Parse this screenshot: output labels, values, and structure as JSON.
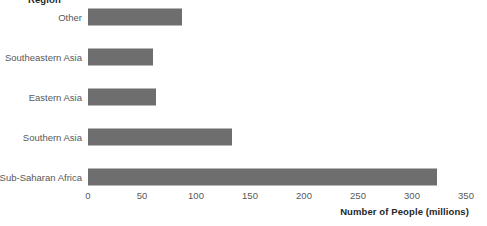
{
  "chart_data": {
    "type": "bar",
    "orientation": "horizontal",
    "title": "",
    "group_title": "Region",
    "xlabel": "Number of People (millions)",
    "ylabel": "Region",
    "categories": [
      "Other",
      "Southeastern Asia",
      "Eastern Asia",
      "Southern Asia",
      "Sub-Saharan Africa"
    ],
    "values": [
      87,
      60,
      63,
      133,
      323
    ],
    "xlim": [
      0,
      350
    ],
    "xticks": [
      0,
      50,
      100,
      150,
      200,
      250,
      300,
      350
    ],
    "xtick_labels": [
      "0",
      "50",
      "100",
      "150",
      "200",
      "250",
      "300",
      "350"
    ],
    "grid": false,
    "legend": "none",
    "bar_color": "#6e6e6e",
    "label_color": "#585858",
    "title_color": "#262626",
    "background": "#ffffff"
  }
}
